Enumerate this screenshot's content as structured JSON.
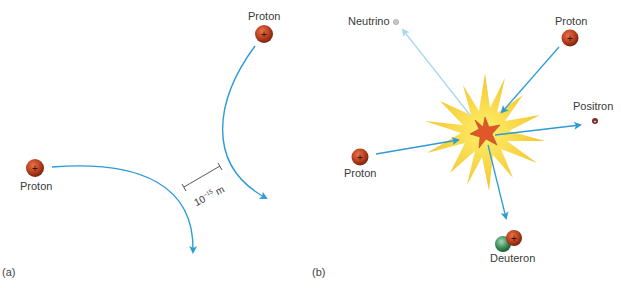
{
  "panels": [
    {
      "id": "a",
      "label": "(a)",
      "particles": [
        {
          "name": "Proton",
          "label": "Proton",
          "charge": "+"
        },
        {
          "name": "Proton",
          "label": "Proton",
          "charge": "+"
        }
      ],
      "scale": {
        "base": "10",
        "exponent": "−15",
        "unit": "m"
      }
    },
    {
      "id": "b",
      "label": "(b)",
      "particles": [
        {
          "label": "Neutrino"
        },
        {
          "label": "Proton",
          "charge": "+"
        },
        {
          "label": "Positron"
        },
        {
          "label": "Proton",
          "charge": "+"
        },
        {
          "label": "Deuteron",
          "charge": "+"
        }
      ]
    }
  ],
  "colors": {
    "proton": "#b8401f",
    "arrow": "#2e9bd6",
    "neutrino_arrow": "#a9d8ee",
    "burst_outer": "#f2c531",
    "burst_inner": "#e0582a",
    "neutron": "#3f8e5c"
  }
}
